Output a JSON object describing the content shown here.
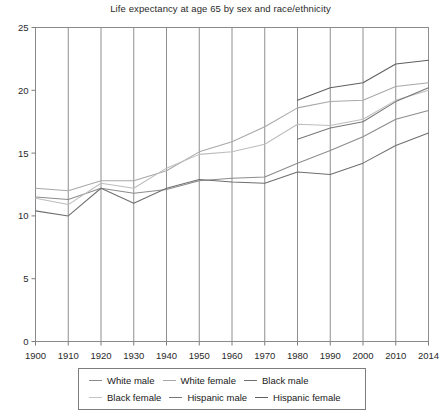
{
  "chart_data": {
    "type": "line",
    "title": "Life expectancy at age 65 by sex and race/ethnicity",
    "xlabel": "",
    "ylabel": "",
    "grid": "vertical",
    "legend_position": "bottom",
    "xlim": [
      0,
      12
    ],
    "ylim": [
      0,
      25
    ],
    "yticks": [
      0,
      5,
      10,
      15,
      20,
      25
    ],
    "categories": [
      "1900",
      "1910",
      "1920",
      "1930",
      "1940",
      "1950",
      "1960",
      "1970",
      "1980",
      "1990",
      "2000",
      "2010",
      "2014"
    ],
    "series": [
      {
        "name": "White male",
        "color": "#8c8c8c",
        "values": [
          11.5,
          11.3,
          12.2,
          11.8,
          12.1,
          12.8,
          13.0,
          13.1,
          14.2,
          15.2,
          16.3,
          17.7,
          18.4
        ]
      },
      {
        "name": "White female",
        "color": "#a8a8a8",
        "values": [
          12.2,
          12.0,
          12.8,
          12.8,
          13.6,
          15.1,
          15.9,
          17.1,
          18.6,
          19.1,
          19.2,
          20.3,
          20.6
        ]
      },
      {
        "name": "Black male",
        "color": "#6f6f6f",
        "values": [
          10.4,
          10.0,
          12.2,
          11.0,
          12.2,
          12.9,
          12.7,
          12.6,
          13.5,
          13.3,
          14.2,
          15.6,
          16.6
        ]
      },
      {
        "name": "Black female",
        "color": "#bdbdbd",
        "values": [
          11.4,
          10.9,
          12.6,
          12.2,
          13.8,
          14.9,
          15.1,
          15.7,
          17.3,
          17.2,
          17.7,
          19.2,
          20.0
        ]
      },
      {
        "name": "Hispanic male",
        "color": "#787878",
        "values": [
          null,
          null,
          null,
          null,
          null,
          null,
          null,
          null,
          16.1,
          17.0,
          17.5,
          19.1,
          20.2
        ]
      },
      {
        "name": "Hispanic female",
        "color": "#5f5f5f",
        "values": [
          null,
          null,
          null,
          null,
          null,
          null,
          null,
          null,
          19.2,
          20.2,
          20.6,
          22.1,
          22.4
        ]
      }
    ]
  },
  "legend": {
    "rows": [
      [
        {
          "label": "White male",
          "color": "#8c8c8c"
        },
        {
          "label": "White female",
          "color": "#a8a8a8"
        },
        {
          "label": "Black male",
          "color": "#6f6f6f"
        }
      ],
      [
        {
          "label": "Black female",
          "color": "#c4c4c4"
        },
        {
          "label": "Hispanic male",
          "color": "#787878"
        },
        {
          "label": "Hispanic female",
          "color": "#5f5f5f"
        }
      ]
    ]
  }
}
